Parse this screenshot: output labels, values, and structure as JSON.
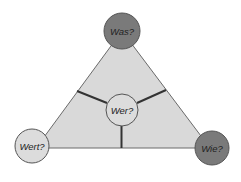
{
  "diagram": {
    "type": "triangle-concept",
    "colors": {
      "triangle_fill": "#d9d9d9",
      "triangle_stroke": "#6a6a6a",
      "dark_circle": "#7a7a7a",
      "light_circle": "#dcdcdc",
      "divider": "#333333"
    },
    "nodes": {
      "top": {
        "label": "Was?"
      },
      "center": {
        "label": "Wer?"
      },
      "bottom_left": {
        "label": "Wert?"
      },
      "bottom_right": {
        "label": "Wie?"
      }
    }
  }
}
